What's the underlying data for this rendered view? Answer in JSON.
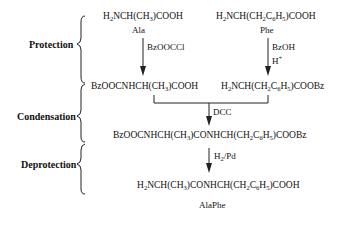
{
  "stages": [
    {
      "label": "Protection"
    },
    {
      "label": "Condensation"
    },
    {
      "label": "Deprotection"
    }
  ],
  "compounds": {
    "ala": {
      "formula_parts": [
        "H",
        "2",
        "NCH(CH",
        "3",
        ")COOH"
      ],
      "name": "Ala"
    },
    "phe": {
      "formula_parts": [
        "H",
        "2",
        "NCH(CH",
        "2",
        "C",
        "6",
        "H",
        "5",
        ")COOH"
      ],
      "name": "Phe"
    },
    "ala_protected": {
      "formula_parts": [
        "BzOOCNHCH(CH",
        "3",
        ")COOH"
      ]
    },
    "phe_protected": {
      "formula_parts": [
        "H",
        "2",
        "NCH(CH",
        "2",
        "C",
        "6",
        "H",
        "5",
        ")COOBz"
      ]
    },
    "dipeptide_protected": {
      "formula_parts": [
        "BzOOCNHCH(CH",
        "3",
        ")CONHCH(CH",
        "2",
        "C",
        "6",
        "H",
        "5",
        ")COOBz"
      ]
    },
    "product": {
      "formula_parts": [
        "H",
        "2",
        "NCH(CH",
        "3",
        ")CONHCH(CH",
        "2",
        "C",
        "6",
        "H",
        "5",
        ")COOH"
      ],
      "name": "AlaPhe"
    }
  },
  "reagents": {
    "ala_protection": "BzOOCCl",
    "phe_protection_1": "BzOH",
    "phe_protection_2": [
      "H",
      "+"
    ],
    "condensation": "DCC",
    "deprotection": [
      "H",
      "2",
      "/Pd"
    ]
  }
}
